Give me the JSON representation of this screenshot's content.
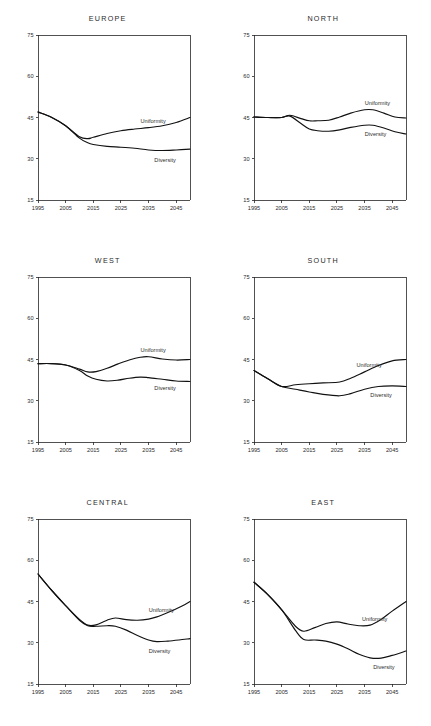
{
  "figure": {
    "panel_titles": [
      "EUROPE",
      "NORTH",
      "WEST",
      "SOUTH",
      "CENTRAL",
      "EAST"
    ],
    "series_names": [
      "Uniformity",
      "Diversity"
    ],
    "line_color": "#111111",
    "axis_color": "#262626",
    "background": "#ffffff"
  },
  "chart_data": [
    {
      "type": "line",
      "title": "EUROPE",
      "xlabel": "",
      "ylabel": "",
      "xlim": [
        1995,
        2050
      ],
      "ylim": [
        15,
        75
      ],
      "yticks": [
        15,
        30,
        45,
        60,
        75
      ],
      "xticks": [
        1995,
        2005,
        2015,
        2025,
        2035,
        2045
      ],
      "grid": false,
      "legend": "inline-annotation",
      "x": [
        1995,
        2000,
        2005,
        2010,
        2013,
        2015,
        2020,
        2025,
        2030,
        2035,
        2040,
        2045,
        2050
      ],
      "series": [
        {
          "name": "Uniformity",
          "values": [
            47.0,
            45.0,
            42.0,
            38.0,
            37.3,
            37.8,
            39.2,
            40.2,
            40.8,
            41.3,
            42.0,
            43.2,
            45.0
          ]
        },
        {
          "name": "Diversity",
          "values": [
            47.0,
            45.0,
            42.0,
            37.5,
            35.8,
            35.2,
            34.5,
            34.2,
            33.8,
            33.2,
            33.0,
            33.2,
            33.5
          ]
        }
      ]
    },
    {
      "type": "line",
      "title": "NORTH",
      "xlabel": "",
      "ylabel": "",
      "xlim": [
        1995,
        2050
      ],
      "ylim": [
        15,
        75
      ],
      "yticks": [
        15,
        30,
        45,
        60,
        75
      ],
      "xticks": [
        1995,
        2005,
        2015,
        2025,
        2035,
        2045
      ],
      "grid": false,
      "legend": "inline-annotation",
      "x": [
        1995,
        2000,
        2005,
        2008,
        2012,
        2015,
        2018,
        2022,
        2026,
        2030,
        2035,
        2038,
        2042,
        2046,
        2050
      ],
      "series": [
        {
          "name": "Uniformity",
          "values": [
            45.2,
            45.0,
            45.0,
            45.8,
            44.6,
            43.8,
            43.8,
            44.0,
            45.2,
            46.6,
            47.8,
            47.8,
            46.6,
            45.2,
            44.8
          ]
        },
        {
          "name": "Diversity",
          "values": [
            45.2,
            45.0,
            45.0,
            45.5,
            42.8,
            40.8,
            40.2,
            40.0,
            40.5,
            41.4,
            42.2,
            42.2,
            41.2,
            39.8,
            39.0
          ]
        }
      ]
    },
    {
      "type": "line",
      "title": "WEST",
      "xlabel": "",
      "ylabel": "",
      "xlim": [
        1995,
        2050
      ],
      "ylim": [
        15,
        75
      ],
      "yticks": [
        15,
        30,
        45,
        60,
        75
      ],
      "xticks": [
        1995,
        2005,
        2015,
        2025,
        2035,
        2045
      ],
      "grid": false,
      "legend": "inline-annotation",
      "x": [
        1995,
        2000,
        2005,
        2010,
        2013,
        2016,
        2020,
        2024,
        2028,
        2032,
        2035,
        2040,
        2045,
        2050
      ],
      "series": [
        {
          "name": "Uniformity",
          "values": [
            43.5,
            43.5,
            43.0,
            41.5,
            40.5,
            40.6,
            41.8,
            43.4,
            44.8,
            45.8,
            46.0,
            45.2,
            44.8,
            45.0
          ]
        },
        {
          "name": "Diversity",
          "values": [
            43.5,
            43.5,
            43.0,
            41.0,
            39.0,
            37.8,
            37.2,
            37.5,
            38.2,
            38.6,
            38.4,
            37.8,
            37.2,
            37.0
          ]
        }
      ]
    },
    {
      "type": "line",
      "title": "SOUTH",
      "xlabel": "",
      "ylabel": "",
      "xlim": [
        1995,
        2050
      ],
      "ylim": [
        15,
        75
      ],
      "yticks": [
        15,
        30,
        45,
        60,
        75
      ],
      "xticks": [
        1995,
        2005,
        2015,
        2025,
        2035,
        2045
      ],
      "grid": false,
      "legend": "inline-annotation",
      "x": [
        1995,
        2000,
        2005,
        2010,
        2015,
        2020,
        2026,
        2030,
        2035,
        2040,
        2045,
        2050
      ],
      "series": [
        {
          "name": "Uniformity",
          "values": [
            41.0,
            38.0,
            35.2,
            35.8,
            36.2,
            36.5,
            36.8,
            38.2,
            40.5,
            42.8,
            44.5,
            45.0
          ]
        },
        {
          "name": "Diversity",
          "values": [
            41.0,
            38.0,
            35.2,
            34.2,
            33.2,
            32.3,
            31.8,
            32.6,
            34.2,
            35.2,
            35.4,
            35.2
          ]
        }
      ]
    },
    {
      "type": "line",
      "title": "CENTRAL",
      "xlabel": "",
      "ylabel": "",
      "xlim": [
        1995,
        2050
      ],
      "ylim": [
        15,
        75
      ],
      "yticks": [
        15,
        30,
        45,
        60,
        75
      ],
      "xticks": [
        1995,
        2005,
        2015,
        2025,
        2035,
        2045
      ],
      "grid": false,
      "legend": "inline-annotation",
      "x": [
        1995,
        2000,
        2005,
        2010,
        2013,
        2016,
        2020,
        2023,
        2027,
        2031,
        2035,
        2038,
        2042,
        2046,
        2050
      ],
      "series": [
        {
          "name": "Uniformity",
          "values": [
            55.0,
            49.0,
            43.5,
            38.5,
            36.4,
            36.5,
            38.2,
            39.0,
            38.4,
            38.2,
            38.6,
            39.4,
            41.0,
            42.8,
            45.0
          ]
        },
        {
          "name": "Diversity",
          "values": [
            55.0,
            49.0,
            43.5,
            38.2,
            36.2,
            36.0,
            36.2,
            36.0,
            34.6,
            32.6,
            31.0,
            30.4,
            30.6,
            31.0,
            31.5
          ]
        }
      ]
    },
    {
      "type": "line",
      "title": "EAST",
      "xlabel": "",
      "ylabel": "",
      "xlim": [
        1995,
        2050
      ],
      "ylim": [
        15,
        75
      ],
      "yticks": [
        15,
        30,
        45,
        60,
        75
      ],
      "xticks": [
        1995,
        2005,
        2015,
        2025,
        2035,
        2045
      ],
      "grid": false,
      "legend": "inline-annotation",
      "x": [
        1995,
        2000,
        2005,
        2010,
        2013,
        2017,
        2021,
        2025,
        2029,
        2033,
        2037,
        2041,
        2045,
        2050
      ],
      "series": [
        {
          "name": "Uniformity",
          "values": [
            52.0,
            47.5,
            42.0,
            36.0,
            34.2,
            35.5,
            37.0,
            37.6,
            36.8,
            36.2,
            36.4,
            38.5,
            41.5,
            45.0
          ]
        },
        {
          "name": "Diversity",
          "values": [
            52.0,
            47.5,
            42.0,
            34.5,
            31.2,
            31.0,
            30.6,
            29.5,
            27.8,
            25.8,
            24.5,
            24.4,
            25.4,
            27.0
          ]
        }
      ]
    }
  ]
}
